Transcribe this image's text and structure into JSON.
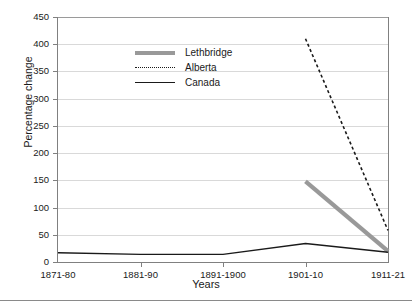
{
  "chart_data": {
    "type": "line",
    "title": "",
    "xlabel": "Years",
    "ylabel": "Percentage change",
    "categories": [
      "1871-80",
      "1881-90",
      "1891-1900",
      "1901-10",
      "1911-21"
    ],
    "ylim": [
      0,
      450
    ],
    "yticks": [
      0,
      50,
      100,
      150,
      200,
      250,
      300,
      350,
      400,
      450
    ],
    "ytick_labels": [
      "0",
      "50",
      "100",
      "150",
      "200",
      "250",
      "300",
      "350",
      "400",
      "450"
    ],
    "grid": true,
    "legend_position": "upper-left-inside",
    "series": [
      {
        "name": "Lethbridge",
        "style": "solid-thick",
        "color": "#999999",
        "x": [
          "1901-10",
          "1911-21"
        ],
        "values": [
          148,
          20
        ]
      },
      {
        "name": "Alberta",
        "style": "dotted",
        "color": "#1a1a1a",
        "x": [
          "1901-10",
          "1911-21"
        ],
        "values": [
          410,
          58
        ]
      },
      {
        "name": "Canada",
        "style": "solid-thin",
        "color": "#1a1a1a",
        "x": [
          "1871-80",
          "1881-90",
          "1891-1900",
          "1901-10",
          "1911-21"
        ],
        "values": [
          17,
          14,
          14,
          34,
          18
        ]
      }
    ]
  },
  "legend": {
    "items": [
      {
        "label": "Lethbridge"
      },
      {
        "label": "Alberta"
      },
      {
        "label": "Canada"
      }
    ]
  }
}
